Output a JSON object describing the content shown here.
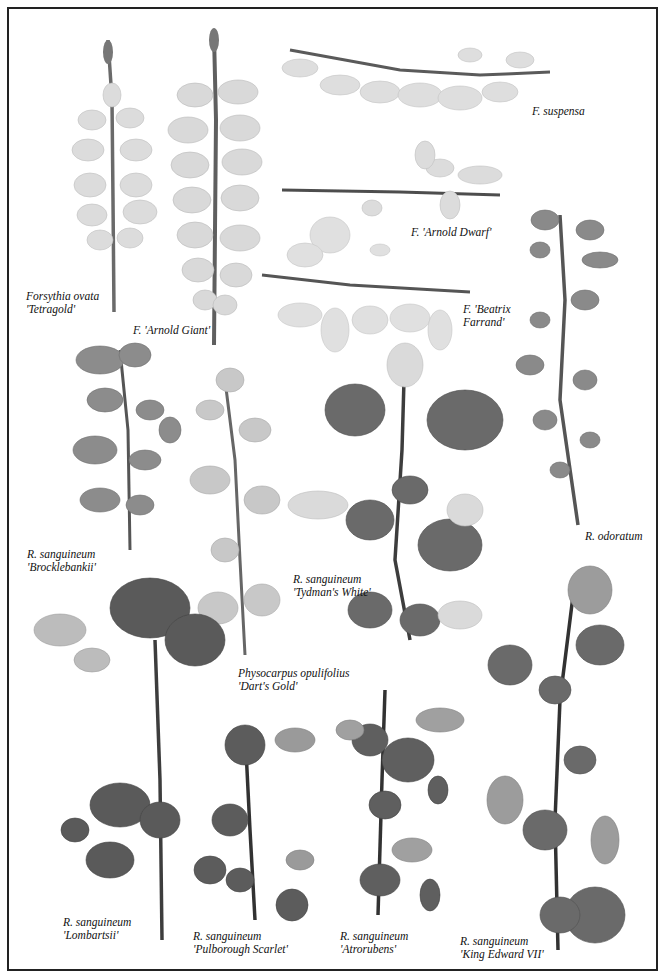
{
  "plate": {
    "type": "botanical specimen photograph plate",
    "colors": {
      "background": "#ffffff",
      "border": "#222222",
      "stem": "#4a4a4a",
      "dark_leaf": "#5a5a5a",
      "pale_flower": "#d8d8d8"
    }
  },
  "labels": [
    {
      "id": "forsythia-ovata",
      "line1": "Forsythia ovata",
      "line2": "'Tetragold'"
    },
    {
      "id": "arnold-giant",
      "line1": "F. 'Arnold Giant'",
      "line2": ""
    },
    {
      "id": "suspensa",
      "line1": "F. suspensa",
      "line2": ""
    },
    {
      "id": "arnold-dwarf",
      "line1": "F. 'Arnold Dwarf'",
      "line2": ""
    },
    {
      "id": "beatrix-farrand",
      "line1": "F. 'Beatrix",
      "line2": "Farrand'"
    },
    {
      "id": "brocklebankii",
      "line1": "R. sanguineum",
      "line2": "'Brocklebankii'"
    },
    {
      "id": "odoratum",
      "line1": "R. odoratum",
      "line2": ""
    },
    {
      "id": "tydmans-white",
      "line1": "R. sanguineum",
      "line2": "'Tydman's White'"
    },
    {
      "id": "darts-gold",
      "line1": "Physocarpus opulifolius",
      "line2": "'Dart's Gold'"
    },
    {
      "id": "lombartsii",
      "line1": "R. sanguineum",
      "line2": "'Lombartsii'"
    },
    {
      "id": "pulborough-scarlet",
      "line1": "R. sanguineum",
      "line2": "'Pulborough Scarlet'"
    },
    {
      "id": "atrorubens",
      "line1": "R. sanguineum",
      "line2": "'Atrorubens'"
    },
    {
      "id": "king-edward-vii",
      "line1": "R. sanguineum",
      "line2": "'King Edward VII'"
    }
  ]
}
